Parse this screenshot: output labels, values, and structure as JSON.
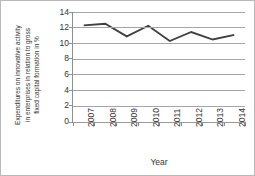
{
  "chart_data": {
    "type": "line",
    "title": "",
    "xlabel": "Year",
    "ylabel": "Expenditures on innovative activity in enterprises in relation to gross fixed capital formation in %",
    "ylabel_lines": [
      "Expenditures on innovative activity",
      "in enterprises in relation to gross",
      "fixed capital formation in %"
    ],
    "categories": [
      "2007",
      "2008",
      "2009",
      "2010",
      "2011",
      "2012",
      "2013",
      "2014"
    ],
    "values": [
      12.3,
      12.5,
      10.9,
      12.25,
      10.3,
      11.45,
      10.5,
      11.1
    ],
    "series": [
      {
        "name": "Expenditures on innovative activity",
        "values": [
          12.3,
          12.5,
          10.9,
          12.25,
          10.3,
          11.45,
          10.5,
          11.1
        ],
        "color": "#404040"
      }
    ],
    "ylim": [
      0,
      14
    ],
    "yticks": [
      0,
      2,
      4,
      6,
      8,
      10,
      12,
      14
    ],
    "ytick_labels": [
      "0",
      "2",
      "4",
      "6",
      "8",
      "10",
      "12",
      "14"
    ],
    "grid": true,
    "grid_axis": "y",
    "legend": false,
    "legend_position": "none",
    "markers": false,
    "line_color": "#404040",
    "grid_color": "#a6a6a6",
    "axis_color": "#8f8f8f",
    "background": "#ffffff"
  }
}
